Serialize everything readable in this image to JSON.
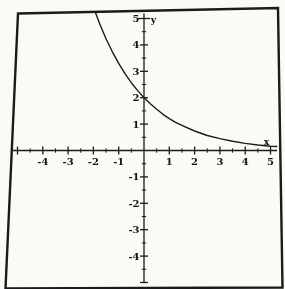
{
  "figure": {
    "background": "#fbfaf7",
    "ink_color": "#222222",
    "border": "scanned rectangular plot frame, slightly skewed"
  },
  "chart_data": {
    "type": "line",
    "title": "",
    "xlabel": "x",
    "ylabel": "y",
    "xlim": [
      -5.2,
      5.3
    ],
    "ylim": [
      -5.1,
      5.2
    ],
    "grid": false,
    "legend": null,
    "minor_tick_step": 0.5,
    "x_labeled_ticks": [
      -4,
      -3,
      -2,
      -1,
      1,
      2,
      3,
      4,
      5
    ],
    "x_tick_labels": [
      "-4",
      "-3",
      "-2",
      "-1",
      "1",
      "2",
      "3",
      "4",
      "5"
    ],
    "y_labeled_ticks": [
      5,
      4,
      3,
      2,
      1,
      -1,
      -2,
      -3,
      -4
    ],
    "y_tick_labels": [
      "5",
      "4",
      "3",
      "2",
      "1",
      "-1",
      "-2",
      "-3",
      "-4"
    ],
    "function_fit": "y ≈ 2·e^(-x/2)",
    "y_intercept": 2,
    "series": [
      {
        "name": "exponential-decay-curve",
        "points": [
          [
            -1.91,
            5.2
          ],
          [
            -1.75,
            4.8
          ],
          [
            -1.5,
            4.23
          ],
          [
            -1.25,
            3.74
          ],
          [
            -1.0,
            3.3
          ],
          [
            -0.75,
            2.91
          ],
          [
            -0.5,
            2.57
          ],
          [
            -0.25,
            2.27
          ],
          [
            0,
            2.0
          ],
          [
            0.25,
            1.77
          ],
          [
            0.5,
            1.56
          ],
          [
            0.75,
            1.37
          ],
          [
            1.0,
            1.21
          ],
          [
            1.25,
            1.07
          ],
          [
            1.5,
            0.95
          ],
          [
            2.0,
            0.74
          ],
          [
            2.5,
            0.57
          ],
          [
            3.0,
            0.45
          ],
          [
            3.5,
            0.35
          ],
          [
            4.0,
            0.27
          ],
          [
            4.5,
            0.21
          ],
          [
            5.0,
            0.16
          ],
          [
            5.25,
            0.15
          ]
        ]
      }
    ]
  }
}
